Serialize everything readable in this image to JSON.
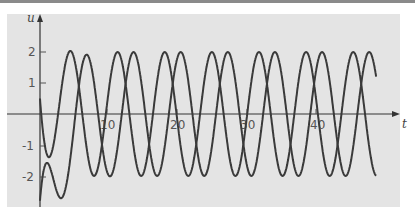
{
  "chart_data": {
    "type": "line",
    "title": "",
    "xlabel": "t",
    "ylabel": "u",
    "xlim": [
      0,
      50
    ],
    "ylim": [
      -2.8,
      2.6
    ],
    "grid": false,
    "legend": null,
    "x_ticks": [
      10,
      20,
      30,
      40
    ],
    "y_ticks": [
      -2,
      -1,
      1,
      2
    ],
    "x_tick_labels": [
      "10",
      "20",
      "30",
      "40"
    ],
    "y_tick_labels": [
      "-2",
      "-1",
      "1",
      "2"
    ],
    "series": [
      {
        "name": "solution-1",
        "description": "starts at u=0.5, dips to about -1.3 near t=3.5, then oscillates with amplitude 2",
        "initial_value": 0.5,
        "amplitude": 2,
        "period": 6.8
      },
      {
        "name": "solution-2",
        "description": "starts near u=-2.8, rises and oscillates with amplitude 2",
        "initial_value": -2.8,
        "amplitude": 2,
        "period": 6.8
      }
    ],
    "peaks_t_approx": [
      4.4,
      6.7,
      11.2,
      13.5,
      18.0,
      20.4,
      24.8,
      27.3,
      31.6,
      34.0,
      38.5,
      40.9,
      45.3,
      47.7
    ]
  },
  "axes": {
    "x_label": "t",
    "y_label": "u"
  },
  "colors": {
    "background": "#e4e4e4",
    "curve": "#3a3a3a",
    "axis": "#333333",
    "ticks": "#555555"
  }
}
